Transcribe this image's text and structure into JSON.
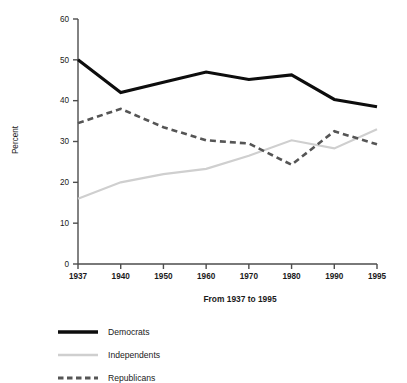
{
  "chart_data": {
    "type": "line",
    "title": "",
    "subtitle": "",
    "xlabel": "From 1937 to 1995",
    "ylabel": "Percent",
    "categories": [
      "1937",
      "1940",
      "1950",
      "1960",
      "1970",
      "1980",
      "1990",
      "1995"
    ],
    "x_tick_labels": [
      "1937",
      "1940",
      "1950",
      "1960",
      "1970",
      "1980",
      "1990",
      "1995"
    ],
    "y_tick_labels": [
      "0",
      "10",
      "20",
      "30",
      "40",
      "50",
      "60"
    ],
    "y_ticks": [
      0,
      10,
      20,
      30,
      40,
      50,
      60
    ],
    "ylim": [
      0,
      60
    ],
    "xlim_index": [
      0,
      7
    ],
    "grid": false,
    "legend_position": "below-left",
    "axis_spacing": "categorical-equal",
    "series": [
      {
        "name": "Democrats",
        "color": "#0d0d0d",
        "style": "solid",
        "width": 3.1,
        "values": [
          50.0,
          42.0,
          44.5,
          47.0,
          45.2,
          46.3,
          40.3,
          38.5
        ]
      },
      {
        "name": "Independents",
        "color": "#cfcfcf",
        "style": "solid",
        "width": 2.2,
        "values": [
          16.0,
          20.0,
          22.0,
          23.3,
          26.5,
          30.3,
          28.3,
          33.0
        ]
      },
      {
        "name": "Republicans",
        "color": "#555555",
        "style": "dashed",
        "width": 2.6,
        "dash": "6,4",
        "values": [
          34.5,
          38.0,
          33.5,
          30.3,
          29.5,
          24.3,
          32.5,
          29.3
        ]
      }
    ]
  },
  "legend": {
    "items": [
      {
        "label": "Democrats",
        "color": "#0d0d0d",
        "style": "solid",
        "width": 3.4
      },
      {
        "label": "Independents",
        "color": "#cfcfcf",
        "style": "solid",
        "width": 2.4
      },
      {
        "label": "Republicans",
        "color": "#555555",
        "style": "dashed",
        "width": 2.8,
        "dash": "5.5,3.5"
      }
    ]
  },
  "layout": {
    "plot_left": 78,
    "plot_right": 377,
    "plot_top": 19,
    "plot_bottom": 264,
    "legend_x_line_start": 58,
    "legend_x_line_end": 98,
    "legend_x_text": 108,
    "legend_y_start": 332,
    "legend_y_step": 23,
    "xlabel_x": 240,
    "xlabel_y": 302,
    "ylabel_x": 18,
    "ylabel_y": 140
  }
}
